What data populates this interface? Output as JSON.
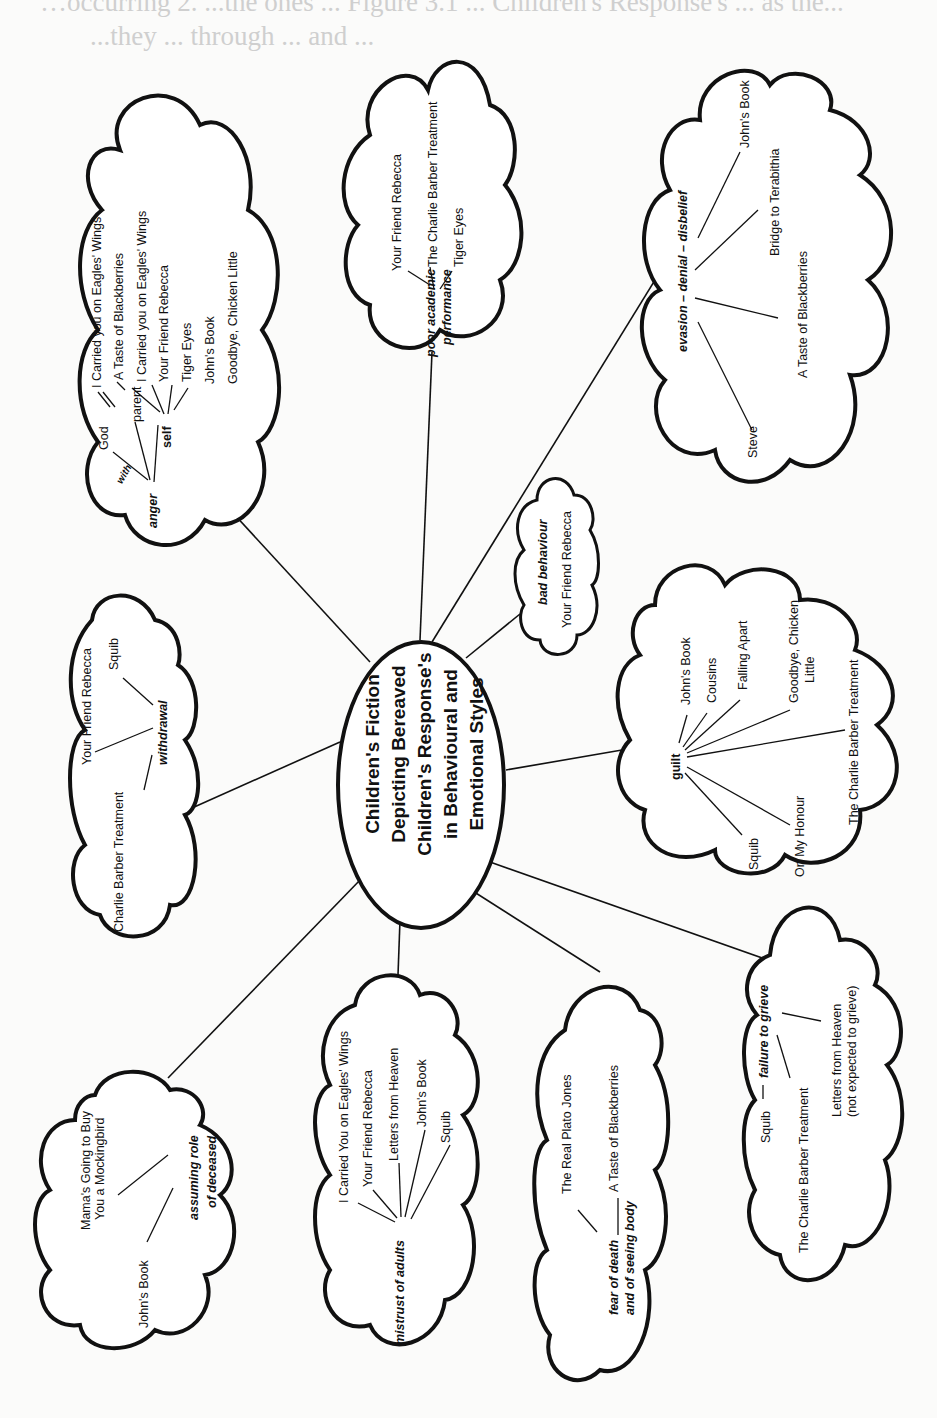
{
  "bleed_through_text": {
    "line1": "…occurring 2. ...the ones ... Figure 3.1 ... Children's Response's ... as the...",
    "line2": "...they ... through ... and ..."
  },
  "center": {
    "title_lines": [
      "Children's Fiction",
      "Depicting Bereaved",
      "Children's Response's",
      "in Behavioural and",
      "Emotional Styles"
    ]
  },
  "clouds": {
    "anger": {
      "theme": "anger",
      "connector": "with",
      "sub_nodes": {
        "god": {
          "label": "God",
          "books": [
            "I Carried you on Eagles' Wings",
            "A Taste of Blackberries"
          ]
        },
        "parent": {
          "label": "parent",
          "books": [
            "I Carried you on Eagles' Wings"
          ]
        },
        "self": {
          "label": "self",
          "books": [
            "Your Friend Rebecca",
            "Tiger Eyes",
            "John's Book",
            "Goodbye, Chicken Little"
          ]
        }
      }
    },
    "poor_academic": {
      "theme_line1": "poor academic",
      "theme_line2": "performance",
      "books": [
        "Your Friend Rebecca",
        "The Charlie Barber Treatment",
        "Tiger Eyes"
      ]
    },
    "evasion": {
      "theme": "evasion – denial – disbelief",
      "books": [
        "John's Book",
        "Bridge to Terabithia",
        "A Taste of Blackberries",
        "Steve"
      ]
    },
    "withdrawal": {
      "theme": "withdrawal",
      "books": [
        "Squib",
        "Your Friend Rebecca",
        "Charlie Barber Treatment"
      ]
    },
    "bad_behaviour": {
      "theme": "bad behaviour",
      "books": [
        "Your Friend Rebecca"
      ]
    },
    "guilt": {
      "theme": "guilt",
      "books": [
        "John's Book",
        "Cousins",
        "Falling Apart",
        "Goodbye, Chicken",
        "Little",
        "The Charlie Barber Treatment",
        "On My Honour",
        "Squib"
      ]
    },
    "assuming_role": {
      "theme_line1": "assuming role",
      "theme_line2": "of deceased",
      "books": [
        "Mama's Going to Buy",
        "You a Mockingbird",
        "John's Book"
      ]
    },
    "mistrust": {
      "theme": "mistrust of adults",
      "books": [
        "I Carried You on Eagles' Wings",
        "Your Friend Rebecca",
        "Letters from Heaven",
        "John's Book",
        "Squib"
      ]
    },
    "fear_of_death": {
      "theme_line1": "fear of death",
      "theme_line2": "and of seeing body",
      "books": [
        "The Real Plato Jones",
        "A Taste of Blackberries"
      ]
    },
    "failure_to_grieve": {
      "theme": "failure to grieve",
      "books": [
        "Squib",
        "The Charlie Barber Treatment",
        "Letters from Heaven",
        "(not expected to grieve)"
      ]
    }
  }
}
